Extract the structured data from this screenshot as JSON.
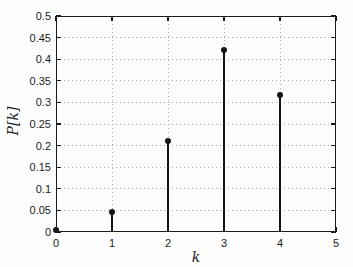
{
  "figure": {
    "colors": {
      "background": "#fdfdfd",
      "axes": "#1c1c1c",
      "grid": "#a8a8a8",
      "stem": "#151515",
      "marker": "#151515",
      "text": "#1c1c1c"
    }
  },
  "chart_data": {
    "type": "stem",
    "title": "",
    "xlabel": "k",
    "ylabel": "P[k]",
    "x": [
      0,
      1,
      2,
      3,
      4
    ],
    "values": [
      0.0039,
      0.0469,
      0.2109,
      0.4219,
      0.3164
    ],
    "xlim": [
      0,
      5
    ],
    "ylim": [
      0,
      0.5
    ],
    "xticks": [
      0,
      1,
      2,
      3,
      4,
      5
    ],
    "xtick_labels": [
      "0",
      "1",
      "2",
      "3",
      "4",
      "5"
    ],
    "yticks": [
      0,
      0.05,
      0.1,
      0.15,
      0.2,
      0.25,
      0.3,
      0.35,
      0.4,
      0.45,
      0.5
    ],
    "ytick_labels": [
      "0",
      "0.05",
      "0.1",
      "0.15",
      "0.2",
      "0.25",
      "0.3",
      "0.35",
      "0.4",
      "0.45",
      "0.5"
    ],
    "grid": true,
    "grid_style": "dotted",
    "box": true,
    "tick_direction": "in",
    "legend": null,
    "marker": "filled-circle"
  }
}
